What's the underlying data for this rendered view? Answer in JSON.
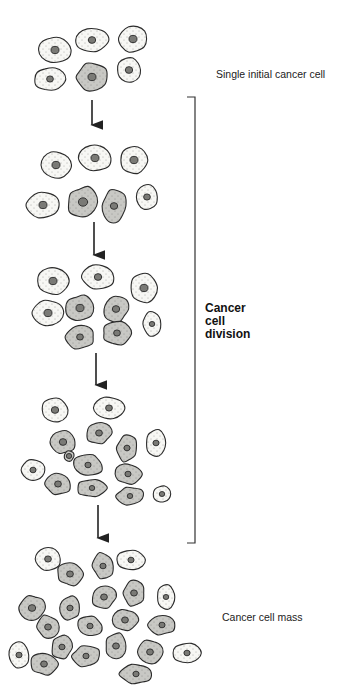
{
  "labels": {
    "initial": "Single initial cancer cell",
    "division": [
      "Cancer",
      "cell",
      "division"
    ],
    "mass": "Cancer cell mass"
  },
  "colors": {
    "normal_fill": "#f7f7f4",
    "cancer_fill": "#c8c8c4",
    "outline": "#2a2a2a",
    "nucleus_fill": "#7a7a76"
  },
  "arrows": [
    {
      "x": 92,
      "y1": 100,
      "y2": 132
    },
    {
      "x": 94,
      "y1": 222,
      "y2": 262
    },
    {
      "x": 96,
      "y1": 353,
      "y2": 392
    },
    {
      "x": 98,
      "y1": 505,
      "y2": 545
    }
  ],
  "bracket": {
    "x": 195,
    "y1": 97,
    "y2": 543,
    "tick": 8
  },
  "stages": [
    {
      "name": "stage-1",
      "cells": [
        {
          "x": 55,
          "y": 50,
          "rx": 16,
          "ry": 13,
          "c": false
        },
        {
          "x": 92,
          "y": 40,
          "rx": 16,
          "ry": 12,
          "c": false
        },
        {
          "x": 133,
          "y": 39,
          "rx": 14,
          "ry": 13,
          "c": false
        },
        {
          "x": 50,
          "y": 79,
          "rx": 16,
          "ry": 11,
          "c": false
        },
        {
          "x": 92,
          "y": 77,
          "rx": 16,
          "ry": 13,
          "c": true
        },
        {
          "x": 129,
          "y": 70,
          "rx": 12,
          "ry": 12,
          "c": false
        }
      ]
    },
    {
      "name": "stage-2",
      "cells": [
        {
          "x": 56,
          "y": 165,
          "rx": 15,
          "ry": 13,
          "c": false
        },
        {
          "x": 95,
          "y": 158,
          "rx": 16,
          "ry": 13,
          "c": false
        },
        {
          "x": 134,
          "y": 160,
          "rx": 13,
          "ry": 14,
          "c": false
        },
        {
          "x": 43,
          "y": 205,
          "rx": 16,
          "ry": 13,
          "c": false
        },
        {
          "x": 83,
          "y": 202,
          "rx": 15,
          "ry": 15,
          "c": true
        },
        {
          "x": 114,
          "y": 206,
          "rx": 12,
          "ry": 16,
          "c": true
        },
        {
          "x": 147,
          "y": 197,
          "rx": 11,
          "ry": 12,
          "c": false
        }
      ]
    },
    {
      "name": "stage-3",
      "cells": [
        {
          "x": 53,
          "y": 281,
          "rx": 16,
          "ry": 13,
          "c": false
        },
        {
          "x": 98,
          "y": 277,
          "rx": 16,
          "ry": 12,
          "c": false
        },
        {
          "x": 144,
          "y": 288,
          "rx": 13,
          "ry": 15,
          "c": false
        },
        {
          "x": 48,
          "y": 313,
          "rx": 15,
          "ry": 13,
          "c": false
        },
        {
          "x": 80,
          "y": 308,
          "rx": 14,
          "ry": 13,
          "c": true
        },
        {
          "x": 116,
          "y": 309,
          "rx": 12,
          "ry": 13,
          "c": true
        },
        {
          "x": 80,
          "y": 337,
          "rx": 15,
          "ry": 11,
          "c": true
        },
        {
          "x": 117,
          "y": 333,
          "rx": 15,
          "ry": 11,
          "c": true
        },
        {
          "x": 152,
          "y": 324,
          "rx": 9,
          "ry": 12,
          "c": false
        }
      ]
    },
    {
      "name": "stage-4",
      "cells": [
        {
          "x": 55,
          "y": 410,
          "rx": 13,
          "ry": 12,
          "c": false
        },
        {
          "x": 109,
          "y": 408,
          "rx": 15,
          "ry": 11,
          "c": false
        },
        {
          "x": 63,
          "y": 442,
          "rx": 12,
          "ry": 12,
          "c": true
        },
        {
          "x": 99,
          "y": 433,
          "rx": 12,
          "ry": 11,
          "c": true
        },
        {
          "x": 127,
          "y": 448,
          "rx": 10,
          "ry": 13,
          "c": true
        },
        {
          "x": 156,
          "y": 443,
          "rx": 10,
          "ry": 13,
          "c": false
        },
        {
          "x": 33,
          "y": 470,
          "rx": 12,
          "ry": 10,
          "c": false
        },
        {
          "x": 88,
          "y": 465,
          "rx": 15,
          "ry": 10,
          "c": true
        },
        {
          "x": 128,
          "y": 474,
          "rx": 13,
          "ry": 10,
          "c": true
        },
        {
          "x": 58,
          "y": 484,
          "rx": 12,
          "ry": 11,
          "c": true
        },
        {
          "x": 92,
          "y": 488,
          "rx": 14,
          "ry": 9,
          "c": true
        },
        {
          "x": 130,
          "y": 496,
          "rx": 13,
          "ry": 9,
          "c": true
        },
        {
          "x": 162,
          "y": 494,
          "rx": 9,
          "ry": 8,
          "c": false
        },
        {
          "x": 69,
          "y": 456,
          "rx": 5,
          "ry": 5,
          "c": true
        }
      ]
    },
    {
      "name": "stage-5",
      "cells": [
        {
          "x": 48,
          "y": 559,
          "rx": 13,
          "ry": 11,
          "c": false
        },
        {
          "x": 70,
          "y": 574,
          "rx": 13,
          "ry": 11,
          "c": true
        },
        {
          "x": 103,
          "y": 566,
          "rx": 10,
          "ry": 13,
          "c": true
        },
        {
          "x": 131,
          "y": 560,
          "rx": 14,
          "ry": 10,
          "c": false
        },
        {
          "x": 32,
          "y": 608,
          "rx": 12,
          "ry": 13,
          "c": true
        },
        {
          "x": 70,
          "y": 608,
          "rx": 10,
          "ry": 12,
          "c": true
        },
        {
          "x": 104,
          "y": 597,
          "rx": 12,
          "ry": 11,
          "c": true
        },
        {
          "x": 134,
          "y": 593,
          "rx": 11,
          "ry": 12,
          "c": true
        },
        {
          "x": 166,
          "y": 597,
          "rx": 9,
          "ry": 12,
          "c": false
        },
        {
          "x": 48,
          "y": 627,
          "rx": 11,
          "ry": 11,
          "c": true
        },
        {
          "x": 90,
          "y": 626,
          "rx": 12,
          "ry": 10,
          "c": true
        },
        {
          "x": 125,
          "y": 620,
          "rx": 12,
          "ry": 11,
          "c": true
        },
        {
          "x": 162,
          "y": 625,
          "rx": 13,
          "ry": 10,
          "c": true
        },
        {
          "x": 62,
          "y": 647,
          "rx": 10,
          "ry": 12,
          "c": true
        },
        {
          "x": 86,
          "y": 656,
          "rx": 14,
          "ry": 10,
          "c": true
        },
        {
          "x": 116,
          "y": 646,
          "rx": 11,
          "ry": 12,
          "c": true
        },
        {
          "x": 150,
          "y": 652,
          "rx": 13,
          "ry": 11,
          "c": true
        },
        {
          "x": 19,
          "y": 655,
          "rx": 10,
          "ry": 13,
          "c": false
        },
        {
          "x": 44,
          "y": 664,
          "rx": 13,
          "ry": 11,
          "c": true
        },
        {
          "x": 136,
          "y": 674,
          "rx": 15,
          "ry": 10,
          "c": true
        },
        {
          "x": 187,
          "y": 653,
          "rx": 14,
          "ry": 10,
          "c": false
        }
      ]
    }
  ]
}
